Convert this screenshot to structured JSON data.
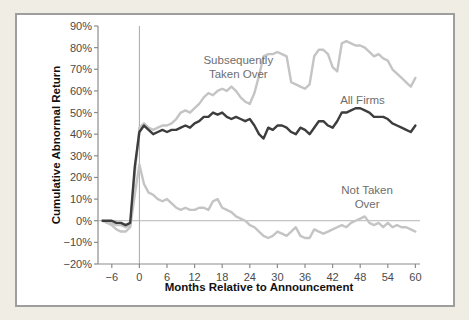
{
  "page": {
    "background_color": "#f0ede5",
    "panel_background": "#ffffff",
    "panel_border_color": "#9e9e9e"
  },
  "chart_data": {
    "type": "line",
    "title": "",
    "xlabel": "Months Relative to Announcement",
    "ylabel": "Cumulative Abnormal Return",
    "x_range": [
      -9,
      61
    ],
    "y_range": [
      -20,
      90
    ],
    "grid": false,
    "zero_line": true,
    "announcement_vline_x": 0,
    "x_ticks": [
      -6,
      0,
      6,
      12,
      18,
      24,
      30,
      36,
      42,
      48,
      54,
      60
    ],
    "x_tick_labels": [
      "−6",
      "0",
      "6",
      "12",
      "18",
      "24",
      "30",
      "36",
      "42",
      "48",
      "54",
      "60"
    ],
    "y_ticks": [
      90,
      80,
      70,
      60,
      50,
      40,
      30,
      20,
      10,
      0,
      -10,
      -20
    ],
    "y_tick_labels": [
      "90%",
      "80%",
      "70%",
      "60%",
      "50%",
      "40%",
      "30%",
      "20%",
      "10%",
      "0%",
      "−10%",
      "−20%"
    ],
    "months": [
      -8,
      -7,
      -6,
      -5,
      -4,
      -3,
      -2,
      -1,
      0,
      1,
      2,
      3,
      4,
      5,
      6,
      7,
      8,
      9,
      10,
      11,
      12,
      13,
      14,
      15,
      16,
      17,
      18,
      19,
      20,
      21,
      22,
      23,
      24,
      25,
      26,
      27,
      28,
      29,
      30,
      31,
      32,
      33,
      34,
      35,
      36,
      37,
      38,
      39,
      40,
      41,
      42,
      43,
      44,
      45,
      46,
      47,
      48,
      49,
      50,
      51,
      52,
      53,
      54,
      55,
      56,
      57,
      58,
      59,
      60
    ],
    "series": [
      {
        "name": "Subsequently Taken Over",
        "color": "#c4c4c4",
        "values": [
          0,
          -1,
          -1,
          -2,
          -2,
          -3,
          -2,
          22,
          43,
          45,
          43,
          42,
          43,
          44,
          44,
          45,
          47,
          50,
          51,
          50,
          52,
          54,
          57,
          59,
          58,
          60,
          61,
          60,
          62,
          60,
          57,
          55,
          54,
          59,
          67,
          76,
          77,
          77,
          78,
          77,
          76,
          64,
          63,
          62,
          61,
          63,
          76,
          79,
          79,
          77,
          71,
          69,
          82,
          83,
          82,
          81,
          81,
          80,
          78,
          76,
          77,
          75,
          74,
          70,
          68,
          66,
          64,
          62,
          66
        ]
      },
      {
        "name": "Not Taken Over",
        "color": "#c4c4c4",
        "values": [
          0,
          -1,
          -2,
          -4,
          -5,
          -5,
          -3,
          12,
          26,
          17,
          13,
          12,
          10,
          9,
          10,
          8,
          6,
          5,
          6,
          5,
          5,
          6,
          6,
          5,
          9,
          10,
          6,
          5,
          4,
          2,
          1,
          0,
          -2,
          -3,
          -5,
          -7,
          -8,
          -7,
          -5,
          -6,
          -7,
          -5,
          -3,
          -7,
          -8,
          -8,
          -4,
          -5,
          -6,
          -5,
          -4,
          -3,
          -2,
          -3,
          -1,
          0,
          1,
          2,
          -1,
          -2,
          -1,
          -3,
          -1,
          -3,
          -2,
          -3,
          -3,
          -4,
          -5,
          -5
        ]
      },
      {
        "name": "All Firms",
        "color": "#3d3d3d",
        "values": [
          0,
          0,
          0,
          -1,
          -1,
          -2,
          -1,
          25,
          41,
          44,
          42,
          40,
          41,
          42,
          41,
          42,
          42,
          43,
          44,
          43,
          45,
          46,
          48,
          48,
          50,
          49,
          50,
          48,
          47,
          48,
          47,
          46,
          47,
          44,
          40,
          38,
          43,
          42,
          44,
          44,
          43,
          41,
          40,
          43,
          42,
          40,
          43,
          46,
          46,
          44,
          43,
          46,
          50,
          50,
          51,
          52,
          52,
          51,
          50,
          48,
          48,
          48,
          47,
          45,
          44,
          43,
          42,
          41,
          44
        ]
      }
    ],
    "annotations": {
      "subsequently": {
        "line1": "Subsequently",
        "line2": "Taken Over",
        "x": 21.5,
        "y": 71
      },
      "all_firms": {
        "line1": "All Firms",
        "x": 48.5,
        "y": 56
      },
      "not_taken": {
        "line1": "Not Taken",
        "line2": "Over",
        "x": 49.5,
        "y": 11
      }
    },
    "style": {
      "axis_color": "#8c8c8c",
      "tick_label_color": "#4a4a4a",
      "zero_line_color": "#b5b5b5",
      "vline_color": "#a8a8a8",
      "line_width": 2.4
    }
  }
}
